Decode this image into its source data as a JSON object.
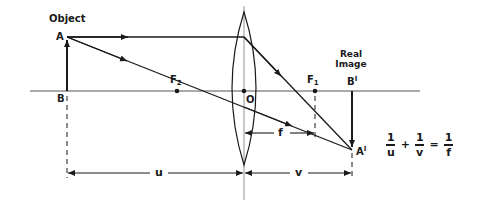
{
  "diagram": {
    "labels": {
      "object": "Object",
      "point_a": "A",
      "point_b": "B",
      "focus_2": "F",
      "focus_2_sub": "2",
      "focus_1": "F",
      "focus_1_sub": "1",
      "optical_center": "O",
      "real_image_line1": "Real",
      "real_image_line2": "Image",
      "point_b_prime": "B",
      "point_a_prime": "A",
      "prime_mark": "I",
      "distance_u": "u",
      "distance_v": "v",
      "distance_f": "f"
    },
    "formula": {
      "term1_num": "1",
      "term1_den": "u",
      "plus": "+",
      "term2_num": "1",
      "term2_den": "v",
      "equals": "=",
      "term3_num": "1",
      "term3_den": "f"
    },
    "colors": {
      "ink": "#1a1a1a",
      "axis": "#555555",
      "background": "#ffffff"
    }
  }
}
